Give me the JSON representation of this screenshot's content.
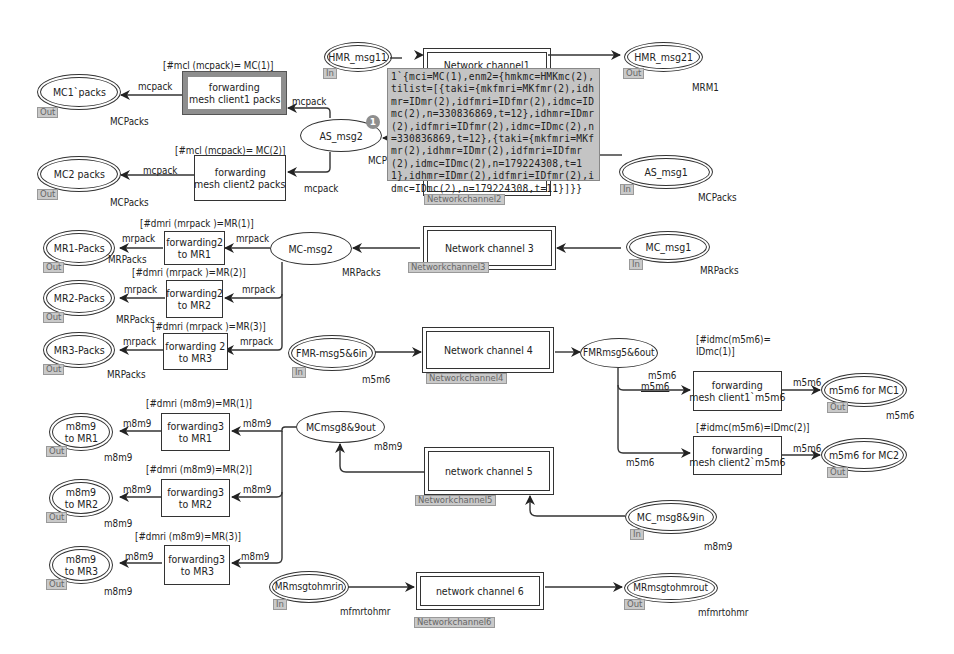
{
  "diagram": {
    "type": "Coloured Petri Net module",
    "places": {
      "mc1_packs": {
        "name": "MC1`packs",
        "port": "Out",
        "colorset": "MCPacks"
      },
      "mc2_packs": {
        "name": "MC2 packs",
        "port": "Out",
        "colorset": "MCPacks"
      },
      "as_msg2": {
        "name": "AS_msg2",
        "colorset": "MCP"
      },
      "hmr_msg11": {
        "name": "HMR_msg11",
        "port": "In"
      },
      "hmr_msg21": {
        "name": "HMR_msg21",
        "port": "Out",
        "colorset": "MRM1"
      },
      "as_msg1": {
        "name": "AS_msg1",
        "port": "In",
        "colorset": "MCPacks"
      },
      "mr1_packs": {
        "name": "MR1-Packs",
        "port": "Out",
        "colorset": "MRPacks"
      },
      "mr2_packs": {
        "name": "MR2-Packs",
        "port": "Out",
        "colorset": "MRPacks"
      },
      "mr3_packs": {
        "name": "MR3-Packs",
        "port": "Out",
        "colorset": "MRPacks"
      },
      "mc_msg2": {
        "name": "MC-msg2",
        "colorset": "MRPacks"
      },
      "mc_msg1": {
        "name": "MC_msg1",
        "port": "In",
        "colorset": "MRPacks"
      },
      "fmr_in": {
        "name": "FMR-msg5&6in",
        "port": "In",
        "colorset": "m5m6"
      },
      "fmr_out": {
        "name": "FMRmsg5&6out"
      },
      "m5m6_mc1": {
        "name": "m5m6 for MC1",
        "port": "Out",
        "colorset": "m5m6"
      },
      "m5m6_mc2": {
        "name": "m5m6 for MC2",
        "port": "Out"
      },
      "m8m9_mr1": {
        "name": "m8m9\nto MR1",
        "line1": "m8m9",
        "line2": "to MR1",
        "port": "Out",
        "colorset": "m8m9"
      },
      "m8m9_mr2": {
        "name": "m8m9\nto MR2",
        "line1": "m8m9",
        "line2": "to MR2",
        "port": "Out",
        "colorset": "m8m9"
      },
      "m8m9_mr3": {
        "name": "m8m9\nto MR3",
        "line1": "m8m9",
        "line2": "to MR3",
        "port": "Out",
        "colorset": "m8m9"
      },
      "mcmsg89_out": {
        "name": "MCmsg8&9out",
        "colorset": "m8m9"
      },
      "mc_msg89_in": {
        "name": "MC_msg8&9in",
        "port": "In",
        "colorset": "m8m9"
      },
      "mr_to_hmr_in": {
        "name": "MRmsgtohmrin",
        "port": "In",
        "colorset": "mfmrtohmr"
      },
      "mr_to_hmr_out": {
        "name": "MRmsgtohmrout",
        "port": "Out",
        "colorset": "mfmrtohmr"
      }
    },
    "transitions": {
      "fwd_mc1": {
        "line1": "forwarding",
        "line2": "mesh client1 packs",
        "guard": "[#mcl (mcpack)= MC(1)]"
      },
      "fwd_mc2": {
        "line1": "forwarding",
        "line2": "mesh client2 packs",
        "guard": "[#mcl (mcpack)= MC(2)]"
      },
      "fwd2_mr1": {
        "line1": "forwarding2",
        "line2": "to MR1",
        "guard": "[#dmri (mrpack )=MR(1)]"
      },
      "fwd2_mr2": {
        "line1": "forwarding2",
        "line2": "to MR2",
        "guard": "[#dmri (mrpack )=MR(2)]"
      },
      "fwd2_mr3": {
        "line1": "forwarding 2",
        "line2": "to MR3",
        "guard": "[#dmri (mrpack )=MR(3)]"
      },
      "fwd_m5m6_1": {
        "line1": "forwarding",
        "line2": "mesh client1`m5m6",
        "guard1": "[#idmc(m5m6)=",
        "guard2": "IDmc(1)]"
      },
      "fwd_m5m6_2": {
        "line1": "forwarding",
        "line2": "mesh client2`m5m6",
        "guard": "[#idmc(m5m6)=IDmc(2)]"
      },
      "fwd3_mr1": {
        "line1": "forwarding3",
        "line2": "to MR1",
        "guard": "[#dmri (m8m9)=MR(1)]"
      },
      "fwd3_mr2": {
        "line1": "forwarding3",
        "line2": "to MR2",
        "guard": "[#dmri (m8m9)=MR(2)]"
      },
      "fwd3_mr3": {
        "line1": "forwarding3",
        "line2": "to MR3",
        "guard": "[#dmri (m8m9)=MR(3)]"
      }
    },
    "substitution_transitions": {
      "nc1": {
        "name": "Network channel1",
        "tag": "Networkchannel2"
      },
      "nc3": {
        "name": "Network channel 3",
        "tag": "Networkchannel3"
      },
      "nc4": {
        "name": "Network channel 4",
        "tag": "Networkchannel4"
      },
      "nc5": {
        "name": "network channel 5",
        "tag": "Networkchannel5"
      },
      "nc6": {
        "name": "network channel 6",
        "tag": "Networkchannel6"
      }
    },
    "arc_labels": {
      "mcpack": "mcpack",
      "mrpack": "mrpack",
      "m5m6": "m5m6",
      "m8m9": "m8m9"
    },
    "marking": {
      "token_count": "1",
      "tooltip": "1`{mci=MC(1),enm2={hmkmc=HMKmc(2),tilist=[{taki={mkfmri=MKfmr(2),idhmr=IDmr(2),idfmri=IDfmr(2),idmc=IDmc(2),n=330836869,t=12},idhmr=IDmr(2),idfmri=IDfmr(2),idmc=IDmc(2),n=330836869,t=12},{taki={mkfmri=MKfmr(2),idhmr=IDmr(2),idfmri=IDfmr(2),idmc=IDmc(2),n=179224308,t=11},idhmr=IDmr(2),idfmri=IDfmr(2),idmc=IDmc(2),n=179224308,t=11}]}}"
    }
  }
}
